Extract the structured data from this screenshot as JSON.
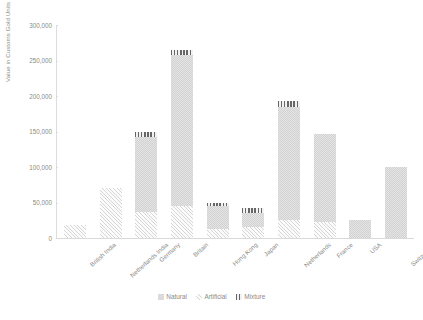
{
  "chart_data": {
    "type": "bar",
    "title": "",
    "subtitle": "",
    "xlabel": "",
    "ylabel": "Value in Customs Gold Units",
    "ylim": [
      0,
      300000
    ],
    "ytick_labels": [
      "300,000",
      "250,000",
      "200,000",
      "150,000",
      "100,000",
      "50,000",
      "0"
    ],
    "ytick_values": [
      300000,
      250000,
      200000,
      150000,
      100000,
      50000,
      0
    ],
    "grid": false,
    "stacked": true,
    "legend_position": "bottom",
    "categories": [
      "British India",
      "Netherlands India",
      "Germany",
      "Britain",
      "Hong Kong",
      "Japan",
      "Netherlands",
      "France",
      "USA",
      "Switzerland"
    ],
    "series": [
      {
        "name": "Natural",
        "pattern": "dotted-checker",
        "color": "#e0e0e0",
        "values": [
          0,
          0,
          106000,
          213000,
          33000,
          20000,
          160000,
          125000,
          25000,
          100000
        ]
      },
      {
        "name": "Artificial",
        "pattern": "diagonal-hatch",
        "color": "#f0f0f0",
        "values": [
          18000,
          70000,
          36000,
          45000,
          12000,
          15000,
          25000,
          22000,
          0,
          0
        ]
      },
      {
        "name": "Mixture",
        "pattern": "vertical-lines",
        "color": "#6e6e6e",
        "values": [
          0,
          0,
          8000,
          7000,
          5000,
          7000,
          8000,
          0,
          0,
          0
        ]
      }
    ],
    "totals": [
      18000,
      70000,
      150000,
      265000,
      50000,
      42000,
      193000,
      147000,
      25000,
      100000
    ]
  },
  "legend": {
    "items": [
      {
        "label": "Natural"
      },
      {
        "label": "Artificial"
      },
      {
        "label": "Mixture"
      }
    ]
  },
  "axes": {
    "y_title": "Value in Customs Gold Units"
  }
}
